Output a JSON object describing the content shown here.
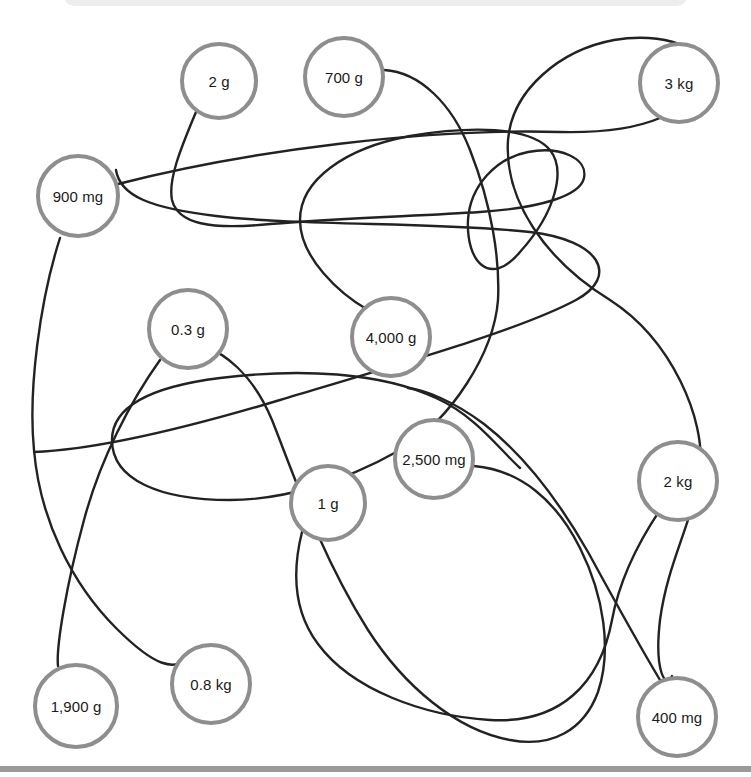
{
  "page": {
    "background_color": "#ffffff",
    "top_panel_color": "#eceded",
    "bottom_rule_color": "#9a9a9a"
  },
  "style": {
    "node_border_color": "#8e8e8e",
    "node_fill_color": "#ffffff",
    "node_text_color": "#1a1a1a",
    "wire_color": "#222222"
  },
  "nodes": [
    {
      "id": "n-2g",
      "label": "2 g",
      "cx": 219,
      "cy": 81,
      "r": 39
    },
    {
      "id": "n-700g",
      "label": "700 g",
      "cx": 344,
      "cy": 77,
      "r": 41
    },
    {
      "id": "n-3kg",
      "label": "3 kg",
      "cx": 679,
      "cy": 83,
      "r": 41
    },
    {
      "id": "n-900mg",
      "label": "900 mg",
      "cx": 78,
      "cy": 196,
      "r": 42
    },
    {
      "id": "n-03g",
      "label": "0.3 g",
      "cx": 188,
      "cy": 329,
      "r": 41
    },
    {
      "id": "n-4000g",
      "label": "4,000 g",
      "cx": 391,
      "cy": 337,
      "r": 41
    },
    {
      "id": "n-2500mg",
      "label": "2,500 mg",
      "cx": 434,
      "cy": 459,
      "r": 41
    },
    {
      "id": "n-2kg",
      "label": "2 kg",
      "cx": 678,
      "cy": 481,
      "r": 41
    },
    {
      "id": "n-1g",
      "label": "1 g",
      "cx": 328,
      "cy": 503,
      "r": 39
    },
    {
      "id": "n-08kg",
      "label": "0.8 kg",
      "cx": 211,
      "cy": 684,
      "r": 41
    },
    {
      "id": "n-1900g",
      "label": "1,900 g",
      "cx": 76,
      "cy": 706,
      "r": 43
    },
    {
      "id": "n-400mg",
      "label": "400 mg",
      "cx": 677,
      "cy": 717,
      "r": 41
    }
  ],
  "wires": [
    {
      "id": "w-900mg-3kg",
      "d": "M 118 184 C 250 150 430 128 560 132 C 650 134 690 110 700 80 C 712 45 660 32 614 40 C 560 50 512 90 508 140 C 504 200 545 260 610 300 C 672 340 706 420 700 470 C 694 520 668 560 660 620 C 654 672 666 690 672 676"
    },
    {
      "id": "w-2g-loop",
      "d": "M 196 112 C 180 150 168 180 172 200 C 178 224 210 230 270 224 C 340 218 420 216 480 212 C 540 208 580 196 584 178 C 588 158 560 146 528 152 C 496 158 470 186 468 220 C 466 262 490 288 520 252 C 556 212 566 170 550 150 C 530 126 470 126 410 136 C 345 148 300 180 300 220 C 300 258 340 294 368 310"
    },
    {
      "id": "w-700g-4000g",
      "d": "M 384 70 C 420 72 452 104 470 150 C 492 206 500 260 498 300 C 494 352 452 420 400 450 C 340 484 280 500 230 500 C 160 500 112 480 112 440 C 112 404 156 386 220 378 C 300 368 380 372 436 398 C 476 416 500 450 520 468"
    },
    {
      "id": "w-900mg-curve",
      "d": "M 60 238 C 40 300 28 390 34 450 C 40 520 72 584 116 628 C 150 662 178 680 196 648"
    },
    {
      "id": "w-03g-1900g",
      "d": "M 160 360 C 130 402 100 460 84 520 C 66 586 56 648 58 666"
    },
    {
      "id": "w-long-arc",
      "d": "M 34 452 C 90 450 180 430 280 400 C 400 364 520 330 576 300 C 620 276 600 240 530 232 C 440 222 300 226 216 216 C 150 208 120 196 116 170"
    },
    {
      "id": "w-1g-2kg",
      "d": "M 302 532 C 292 572 294 612 318 644 C 352 690 424 716 490 720 C 560 724 600 684 612 620 C 622 566 652 522 660 510"
    },
    {
      "id": "w-2500mg-sweep",
      "d": "M 474 466 C 520 470 556 500 580 548 C 604 596 612 650 598 692 C 584 730 552 748 510 740 C 456 730 404 686 368 630 C 320 554 292 470 272 420 C 252 372 222 352 206 348"
    },
    {
      "id": "w-400mg-2kg",
      "d": "M 660 680 C 636 640 612 596 588 552 C 556 496 520 452 484 424 C 452 400 424 390 408 388"
    }
  ]
}
